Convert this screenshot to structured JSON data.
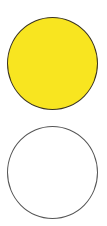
{
  "circles": [
    {
      "name": "filled",
      "fill": "#f8e520",
      "stroke": "#3a3320"
    },
    {
      "name": "empty",
      "fill": "#ffffff",
      "stroke": "#555555"
    }
  ]
}
